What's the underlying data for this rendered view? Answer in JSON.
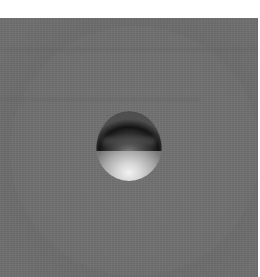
{
  "image": {
    "description": "Grayscale microscopy-style image of a single spherical particle with dark upper rim and bright lower highlight on a uniform gray background",
    "colors": {
      "background": "#6f6f6f",
      "top_strip": "#ffffff",
      "particle_shadow": "#1a1a1a",
      "particle_highlight": "#f2f2f2"
    }
  }
}
